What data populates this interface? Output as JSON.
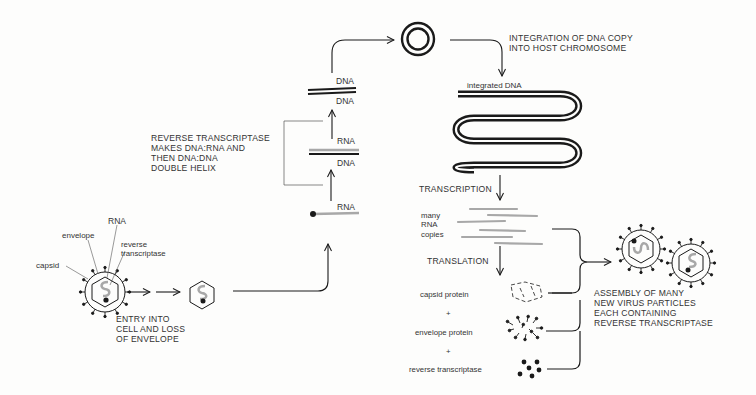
{
  "diagram": {
    "virion_labels": {
      "rna": "RNA",
      "envelope": "envelope",
      "reverse_transcriptase": "reverse\ntranscriptase",
      "capsid": "capsid"
    },
    "steps": {
      "entry": "ENTRY INTO\nCELL AND LOSS\nOF ENVELOPE",
      "reverse_transcription": "REVERSE TRANSCRIPTASE\nMAKES DNA:RNA AND\nTHEN DNA:DNA\nDOUBLE HELIX",
      "integration": "INTEGRATION OF DNA COPY\nINTO HOST CHROMOSOME",
      "transcription": "TRANSCRIPTION",
      "translation": "TRANSLATION",
      "assembly": "ASSEMBLY OF MANY\nNEW VIRUS PARTICLES\nEACH CONTAINING\nREVERSE TRANSCRIPTASE"
    },
    "strand_labels": {
      "rna_single": "RNA",
      "hybrid_top": "RNA",
      "hybrid_bottom": "DNA",
      "ds_top": "DNA",
      "ds_bottom": "DNA",
      "integrated": "integrated DNA",
      "many_rna": "many\nRNA\ncopies"
    },
    "products": {
      "capsid_protein": "capsid protein",
      "plus1": "+",
      "envelope_protein": "envelope protein",
      "plus2": "+",
      "reverse_transcriptase": "reverse transcriptase"
    },
    "colors": {
      "ink": "#1a1a1a",
      "rna_gray": "#a8a8a8",
      "text": "#333333",
      "background": "#fdfdfc"
    }
  }
}
